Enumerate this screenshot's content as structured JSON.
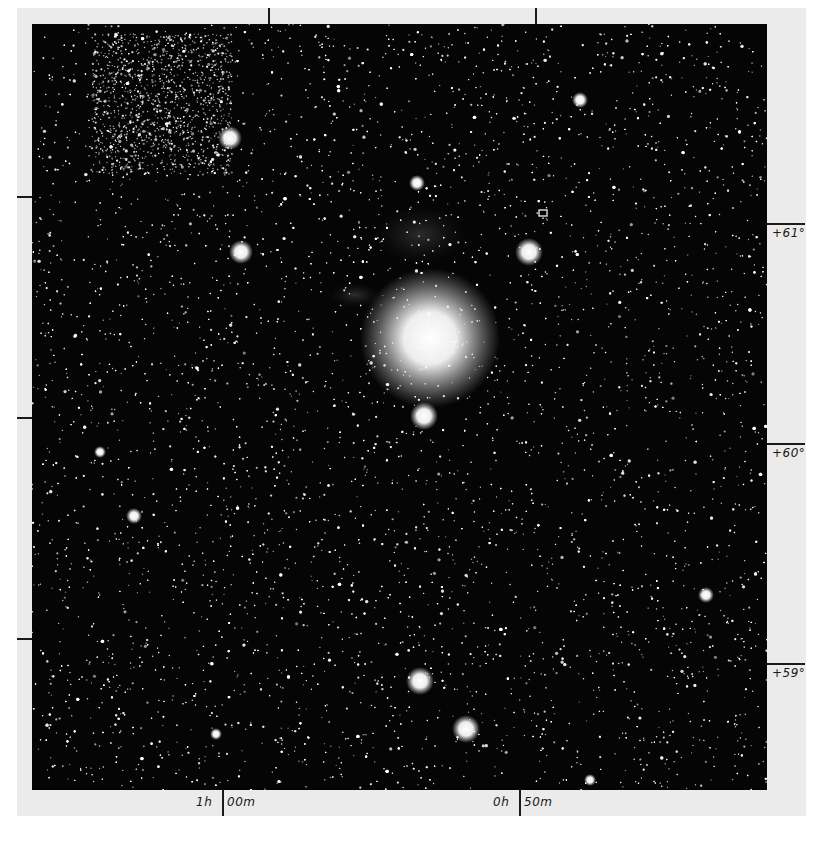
{
  "figure": {
    "background_paper_color": "#ebebeb",
    "plate_color": "#050505"
  },
  "axes": {
    "ra_labels": [
      {
        "hours": "1h",
        "minutes": "00m",
        "x": 222
      },
      {
        "hours": "0h",
        "minutes": "50m",
        "x": 519
      }
    ],
    "top_ticks_x": [
      268,
      535
    ],
    "left_ticks_y": [
      196,
      417,
      638
    ],
    "dec_labels": [
      {
        "text": "+61°",
        "y": 223
      },
      {
        "text": "+60°",
        "y": 443
      },
      {
        "text": "+59°",
        "y": 663
      }
    ]
  },
  "bright_stars": [
    {
      "x": 430,
      "y": 338,
      "r": 26,
      "glow": 70,
      "name": "central-bright-star"
    },
    {
      "x": 424,
      "y": 416,
      "r": 7,
      "glow": 14
    },
    {
      "x": 529,
      "y": 252,
      "r": 7,
      "glow": 14
    },
    {
      "x": 241,
      "y": 252,
      "r": 6,
      "glow": 12
    },
    {
      "x": 230,
      "y": 138,
      "r": 6,
      "glow": 12
    },
    {
      "x": 420,
      "y": 681,
      "r": 7,
      "glow": 14
    },
    {
      "x": 466,
      "y": 729,
      "r": 7,
      "glow": 14
    },
    {
      "x": 580,
      "y": 100,
      "r": 4,
      "glow": 8
    },
    {
      "x": 417,
      "y": 183,
      "r": 4,
      "glow": 8
    },
    {
      "x": 134,
      "y": 516,
      "r": 4,
      "glow": 8
    },
    {
      "x": 706,
      "y": 595,
      "r": 4,
      "glow": 8
    },
    {
      "x": 100,
      "y": 452,
      "r": 3,
      "glow": 6
    },
    {
      "x": 216,
      "y": 734,
      "r": 3,
      "glow": 6
    },
    {
      "x": 590,
      "y": 780,
      "r": 3,
      "glow": 6
    }
  ],
  "nebulosity": [
    {
      "x": 420,
      "y": 235,
      "rx": 45,
      "ry": 28
    },
    {
      "x": 355,
      "y": 295,
      "rx": 25,
      "ry": 12
    }
  ],
  "artifact": {
    "x": 543,
    "y": 213
  },
  "star_field": {
    "count": 9000,
    "seed": 12345
  }
}
